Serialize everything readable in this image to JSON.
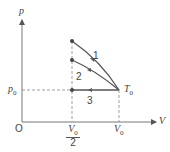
{
  "diagram": {
    "type": "P-V diagram",
    "axes": {
      "x_label": "V",
      "y_label": "p",
      "origin_label": "O"
    },
    "ticks": {
      "x": [
        {
          "label_num": "V",
          "label_sub": "0",
          "label_den": "2",
          "value": "V0/2"
        },
        {
          "label": "V",
          "label_sub": "0",
          "value": "V0"
        }
      ],
      "y": [
        {
          "label": "p",
          "label_sub": "0",
          "value": "p0"
        }
      ]
    },
    "state_label": {
      "text": "T",
      "sub": "0"
    },
    "processes": [
      {
        "id": "1",
        "label": "1"
      },
      {
        "id": "2",
        "label": "2"
      },
      {
        "id": "3",
        "label": "3"
      }
    ],
    "colors": {
      "line": "#555555",
      "axis": "#777777",
      "dash": "#888888"
    }
  }
}
